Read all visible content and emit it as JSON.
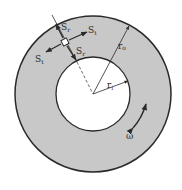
{
  "diagram": {
    "type": "rotating-disk-stress-element",
    "colors": {
      "disk_fill": "#c8c8c8",
      "outline": "#2a2a2a",
      "background": "#ffffff",
      "hole_fill": "#ffffff"
    },
    "geometry": {
      "center": [
        93,
        94
      ],
      "outer_radius": 78,
      "inner_radius": 37,
      "element_position": [
        65,
        42
      ]
    },
    "labels": {
      "s_r_top": {
        "main": "S",
        "sub": "r"
      },
      "s_t_right": {
        "main": "S",
        "sub": "t"
      },
      "s_t_left": {
        "main": "S",
        "sub": "t"
      },
      "s_r_bottom": {
        "main": "S",
        "sub": "r"
      },
      "outer_radius": {
        "main": "r",
        "sub": "o"
      },
      "inner_radius": {
        "main": "r",
        "sub": "i"
      },
      "angular_velocity": "ω"
    }
  }
}
